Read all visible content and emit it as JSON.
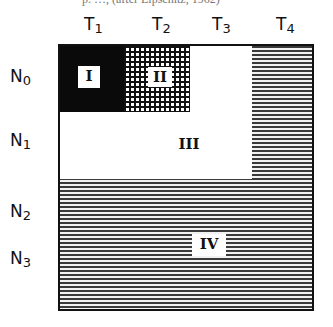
{
  "caption_fragment": "p. …, (after Lipschitz, 1962)",
  "columns": [
    {
      "label": "T",
      "sub": "1"
    },
    {
      "label": "T",
      "sub": "2"
    },
    {
      "label": "T",
      "sub": "3"
    },
    {
      "label": "T",
      "sub": "4"
    }
  ],
  "rows": [
    {
      "label": "N",
      "sub": "0"
    },
    {
      "label": "N",
      "sub": "1"
    },
    {
      "label": "N",
      "sub": "2"
    },
    {
      "label": "N",
      "sub": "3"
    }
  ],
  "regions": [
    {
      "id": "I",
      "label": "I",
      "fill": "solid-black",
      "span": "T1 × N0"
    },
    {
      "id": "II",
      "label": "II",
      "fill": "cross-hatch",
      "span": "T2 × N0"
    },
    {
      "id": "III",
      "label": "III",
      "fill": "white",
      "span": "T1–T3 × N0–N1 (excluding I, II)"
    },
    {
      "id": "IV",
      "label": "IV",
      "fill": "horizontal-hatch",
      "span": "T4 all rows + N2–N3 all columns"
    }
  ],
  "colors": {
    "ink": "#111111",
    "paper": "#ffffff"
  }
}
